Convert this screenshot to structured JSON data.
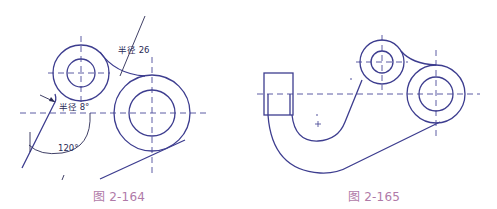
{
  "colors": {
    "outline": "#3d3d8f",
    "centerline": "#4a4a9a",
    "dimension": "#2a2a55",
    "caption": "#b07aa8",
    "background": "#ffffff"
  },
  "figures": [
    {
      "id": "fig-2-164",
      "caption": "图 2-164",
      "annotations": {
        "radius_26": "半径 26",
        "radius_8": "半径 8°",
        "angle_120": "120°"
      }
    },
    {
      "id": "fig-2-165",
      "caption": "图 2-165"
    }
  ]
}
